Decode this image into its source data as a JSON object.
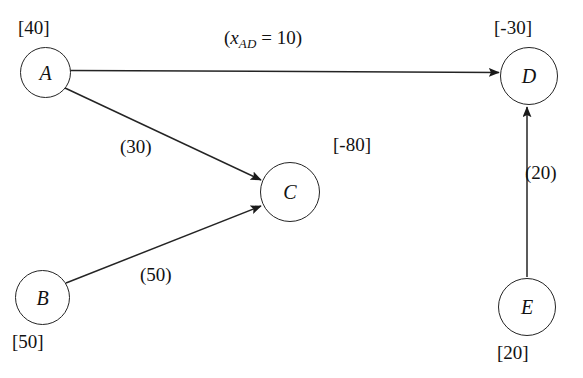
{
  "figure": {
    "type": "minimum-cost-network-flow-diagram",
    "background_color": "#ffffff",
    "line_color": "#242424",
    "text_color": "#121212"
  },
  "nodes": [
    {
      "id": "A",
      "letter": "A",
      "supply_label": "[40]",
      "supply_value": 40,
      "label_position": "above-left",
      "cx": 45,
      "cy": 72
    },
    {
      "id": "B",
      "letter": "B",
      "supply_label": "[50]",
      "supply_value": 50,
      "label_position": "below-left",
      "cx": 42,
      "cy": 297
    },
    {
      "id": "C",
      "letter": "C",
      "supply_label": "[-80]",
      "supply_value": -80,
      "label_position": "above-right",
      "cx": 290,
      "cy": 192
    },
    {
      "id": "D",
      "letter": "D",
      "supply_label": "[-30]",
      "supply_value": -30,
      "label_position": "above",
      "cx": 529,
      "cy": 76
    },
    {
      "id": "E",
      "letter": "E",
      "supply_label": "[20]",
      "supply_value": 20,
      "label_position": "below",
      "cx": 527,
      "cy": 307
    }
  ],
  "arcs": [
    {
      "id": "AD",
      "from": "A",
      "to": "D",
      "label_text": "(x_AD = 10)",
      "label_parts": {
        "open": "(",
        "variable": "x",
        "subscript": "AD",
        "equals": " = ",
        "value": "10",
        "close": ")"
      },
      "value": 10
    },
    {
      "id": "AC",
      "from": "A",
      "to": "C",
      "label_text": "(30)",
      "value": 30
    },
    {
      "id": "BC",
      "from": "B",
      "to": "C",
      "label_text": "(50)",
      "value": 50
    },
    {
      "id": "ED",
      "from": "E",
      "to": "D",
      "label_text": "(20)",
      "value": 20
    }
  ],
  "caption": {
    "fragment": ""
  }
}
